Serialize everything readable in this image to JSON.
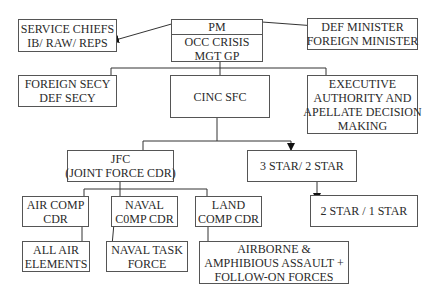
{
  "diagram": {
    "nodes": {
      "pm": {
        "line1": "PM",
        "line2": "OCC CRISIS",
        "line3": "MGT GP"
      },
      "service_chiefs": {
        "line1": "SERVICE CHIEFS",
        "line2": "IB/ RAW/ REPS"
      },
      "def_minister": {
        "line1": "DEF MINISTER",
        "line2": "FOREIGN MINISTER"
      },
      "foreign_secy": {
        "line1": "FOREIGN SECY",
        "line2": "DEF SECY"
      },
      "cinc_sfc": {
        "line1": "CINC SFC"
      },
      "executive": {
        "line1": "EXECUTIVE",
        "line2": "AUTHORITY AND",
        "line3": "APELLATE DECISION",
        "line4": "MAKING"
      },
      "jfc": {
        "line1": "JFC",
        "line2": "(JOINT FORCE CDR)"
      },
      "three_star": {
        "line1": "3 STAR/ 2 STAR"
      },
      "two_star": {
        "line1": "2 STAR / 1 STAR"
      },
      "air_comp": {
        "line1": "AIR COMP",
        "line2": "CDR"
      },
      "naval_comp": {
        "line1": "NAVAL",
        "line2": "C0MP CDR"
      },
      "land_comp": {
        "line1": "LAND",
        "line2": "COMP CDR"
      },
      "all_air": {
        "line1": "ALL AIR",
        "line2": "ELEMENTS"
      },
      "naval_task": {
        "line1": "NAVAL TASK",
        "line2": "FORCE"
      },
      "airborne": {
        "line1": "AIRBORNE &",
        "line2": "AMPHIBIOUS ASSAULT +",
        "line3": "FOLLOW-ON FORCES"
      }
    },
    "edges": [
      {
        "from": "pm",
        "to": "service_chiefs"
      },
      {
        "from": "pm",
        "to": "def_minister"
      },
      {
        "from": "pm",
        "to": "foreign_secy"
      },
      {
        "from": "pm",
        "to": "cinc_sfc"
      },
      {
        "from": "pm",
        "to": "executive"
      },
      {
        "from": "cinc_sfc",
        "to": "jfc"
      },
      {
        "from": "cinc_sfc",
        "to": "three_star"
      },
      {
        "from": "three_star",
        "to": "two_star"
      },
      {
        "from": "jfc",
        "to": "air_comp"
      },
      {
        "from": "jfc",
        "to": "naval_comp"
      },
      {
        "from": "jfc",
        "to": "land_comp"
      },
      {
        "from": "air_comp",
        "to": "all_air"
      },
      {
        "from": "naval_comp",
        "to": "naval_task"
      },
      {
        "from": "land_comp",
        "to": "airborne"
      }
    ]
  }
}
